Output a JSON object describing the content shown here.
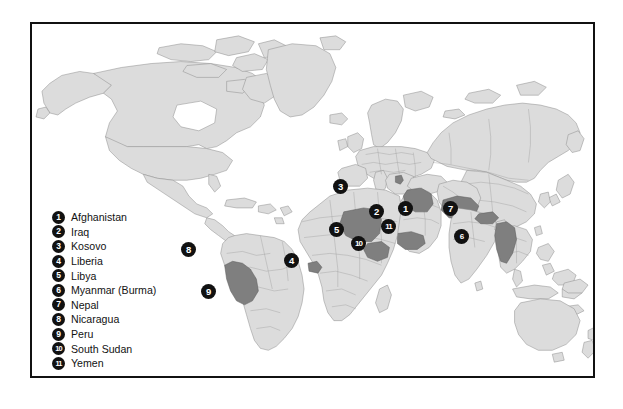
{
  "map": {
    "title": "World map with numbered country markers",
    "colors": {
      "ocean": "#ffffff",
      "land_fill": "#dcdcdc",
      "land_stroke": "#8a8a8a",
      "highlight_fill": "#7f7f7f",
      "highlight_stroke": "#5a5a5a",
      "frame": "#111111",
      "marker_fill": "#111111",
      "marker_text": "#ffffff"
    },
    "frame": {
      "x": 30,
      "y": 22,
      "width": 565,
      "height": 356,
      "border_width": 2.5
    }
  },
  "legend": {
    "items": [
      {
        "number": "1",
        "label": "Afghanistan"
      },
      {
        "number": "2",
        "label": "Iraq"
      },
      {
        "number": "3",
        "label": "Kosovo"
      },
      {
        "number": "4",
        "label": "Liberia"
      },
      {
        "number": "5",
        "label": "Libya"
      },
      {
        "number": "6",
        "label": "Myanmar (Burma)"
      },
      {
        "number": "7",
        "label": "Nepal"
      },
      {
        "number": "8",
        "label": "Nicaragua"
      },
      {
        "number": "9",
        "label": "Peru"
      },
      {
        "number": "10",
        "label": "South Sudan"
      },
      {
        "number": "11",
        "label": "Yemen"
      }
    ]
  },
  "markers": [
    {
      "number": "1",
      "label": "Afghanistan",
      "x": 396,
      "y": 200
    },
    {
      "number": "2",
      "label": "Iraq",
      "x": 367,
      "y": 203
    },
    {
      "number": "3",
      "label": "Kosovo",
      "x": 331,
      "y": 178
    },
    {
      "number": "4",
      "label": "Liberia",
      "x": 282,
      "y": 252
    },
    {
      "number": "5",
      "label": "Libya",
      "x": 327,
      "y": 221
    },
    {
      "number": "6",
      "label": "Myanmar (Burma)",
      "x": 452,
      "y": 228
    },
    {
      "number": "7",
      "label": "Nepal",
      "x": 441,
      "y": 200
    },
    {
      "number": "8",
      "label": "Nicaragua",
      "x": 179,
      "y": 241
    },
    {
      "number": "9",
      "label": "Peru",
      "x": 199,
      "y": 283
    },
    {
      "number": "10",
      "label": "South Sudan",
      "x": 349,
      "y": 235
    },
    {
      "number": "11",
      "label": "Yemen",
      "x": 379,
      "y": 218
    }
  ]
}
